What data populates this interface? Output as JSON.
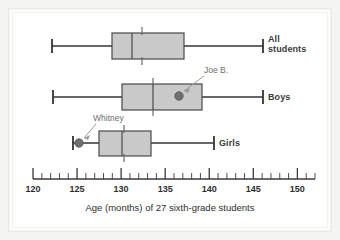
{
  "figure": {
    "caption": "Age (months) of 27 sixth-grade students",
    "background_color": "#ffffff",
    "box_fill_color": "#c9c9c9",
    "line_color": "#333333",
    "annotation_color": "#6d6d6d"
  },
  "axis": {
    "min": 120,
    "max": 152,
    "tick_labels": [
      "120",
      "125",
      "130",
      "135",
      "140",
      "145",
      "150"
    ],
    "tick_values": [
      120,
      125,
      130,
      135,
      140,
      145,
      150
    ],
    "minor_tick_step": 1,
    "title": "Age (months) of 27 sixth-grade students"
  },
  "series_labels": {
    "all_students": "All\nstudents",
    "boys": "Boys",
    "girls": "Girls"
  },
  "annotations": [
    {
      "name": "joe-b",
      "label": "Joe B.",
      "value": 137.4,
      "series": "Boys"
    },
    {
      "name": "whitney",
      "label": "Whitney",
      "value": 124.7,
      "series": "Girls"
    }
  ],
  "chart_data": {
    "type": "box",
    "title": "Age (months) of 27 sixth-grade students",
    "xlabel": "Age (months) of 27 sixth-grade students",
    "ylabel": "",
    "xlim": [
      120,
      152
    ],
    "grid": false,
    "legend": "right-of-plot",
    "orientation": "horizontal",
    "categories": [
      "All students",
      "Boys",
      "Girls"
    ],
    "boxes": [
      {
        "name": "All students",
        "min": 121.3,
        "q1": 128.9,
        "median": 131.4,
        "q3": 138.0,
        "max": 148.1,
        "mean": 132.4
      },
      {
        "name": "Boys",
        "min": 121.4,
        "q1": 130.2,
        "median": 134.1,
        "q3": 140.3,
        "max": 148.1,
        "mean": 135.0,
        "points": [
          {
            "label": "Joe B.",
            "value": 137.4
          }
        ]
      },
      {
        "name": "Girls",
        "min": 124.0,
        "q1": 127.2,
        "median": 130.2,
        "q3": 133.9,
        "max": 141.9,
        "mean": 130.8,
        "points": [
          {
            "label": "Whitney",
            "value": 124.7
          }
        ]
      }
    ]
  }
}
